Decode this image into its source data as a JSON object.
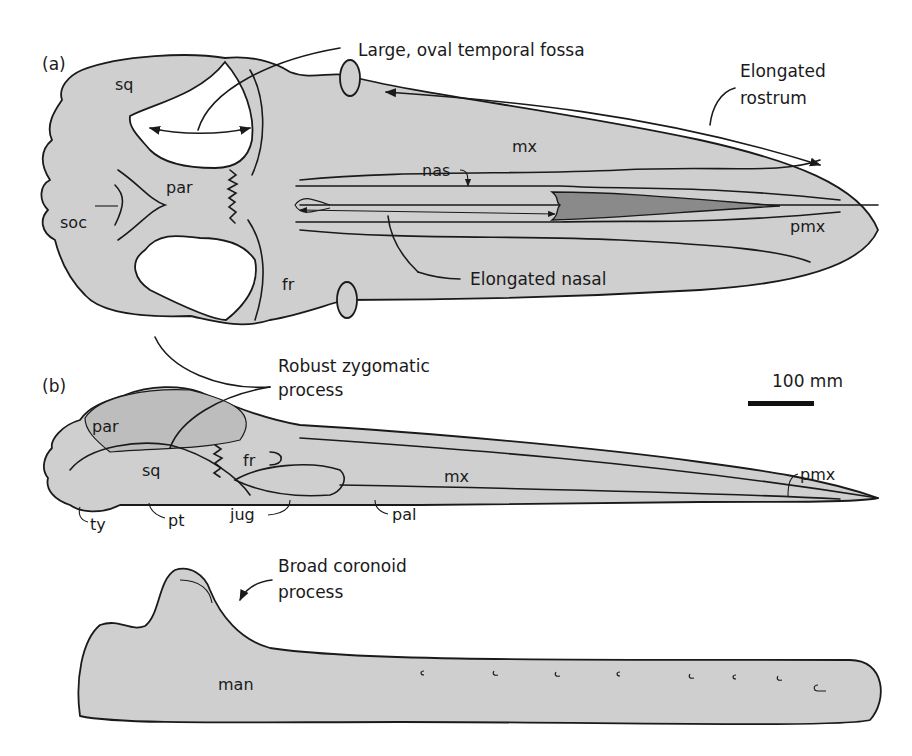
{
  "figure": {
    "panels": [
      {
        "id": "a",
        "label": "(a)",
        "view": "dorsal skull"
      },
      {
        "id": "b",
        "label": "(b)",
        "view": "lateral skull"
      },
      {
        "id": "c",
        "label": "",
        "view": "mandible"
      }
    ],
    "bone_labels": {
      "a": {
        "sq": "sq",
        "par": "par",
        "soc": "soc",
        "fr": "fr",
        "nas": "nas",
        "mx": "mx",
        "pmx": "pmx"
      },
      "b": {
        "par": "par",
        "sq": "sq",
        "fr": "fr",
        "mx": "mx",
        "pmx": "pmx",
        "ty": "ty",
        "pt": "pt",
        "jug": "jug",
        "pal": "pal"
      },
      "c": {
        "man": "man"
      }
    },
    "callouts": {
      "temporal_fossa": "Large, oval temporal fossa",
      "rostrum_line1": "Elongated",
      "rostrum_line2": "rostrum",
      "nasal": "Elongated nasal",
      "zygomatic_line1": "Robust zygomatic",
      "zygomatic_line2": "process",
      "coronoid_line1": "Broad coronoid",
      "coronoid_line2": "process"
    },
    "scale_bar": {
      "label": "100 mm"
    },
    "colors": {
      "bone_fill": "#cfcfcf",
      "dark_fill": "#8a8a8a",
      "outline": "#1a1a1a",
      "background": "#ffffff"
    }
  }
}
